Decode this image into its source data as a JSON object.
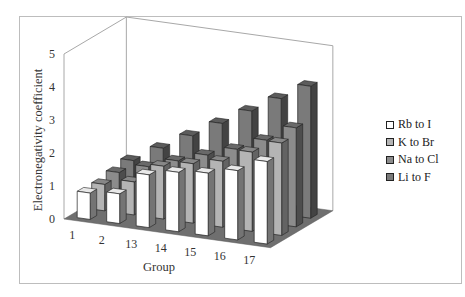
{
  "chart_data": {
    "type": "bar",
    "subtype": "3d-clustered-column",
    "title": "",
    "xlabel": "Group",
    "ylabel": "Electronegativity coefficient",
    "ylim": [
      0,
      5
    ],
    "yticks": [
      "0",
      "1",
      "2",
      "3",
      "4",
      "5"
    ],
    "categories": [
      "1",
      "2",
      "13",
      "14",
      "15",
      "16",
      "17"
    ],
    "series": [
      {
        "name": "Rb to I",
        "color": "#ffffff",
        "values": [
          0.8,
          0.9,
          1.6,
          1.8,
          1.9,
          2.1,
          2.5
        ]
      },
      {
        "name": "K to Br",
        "color": "#b4b4b4",
        "values": [
          0.8,
          1.0,
          1.6,
          1.8,
          2.0,
          2.4,
          2.8
        ]
      },
      {
        "name": "Na to Cl",
        "color": "#8c8c8c",
        "values": [
          0.9,
          1.2,
          1.5,
          1.8,
          2.1,
          2.5,
          3.0
        ]
      },
      {
        "name": "Li to F",
        "color": "#7a7a7a",
        "values": [
          1.0,
          1.5,
          2.0,
          2.5,
          3.0,
          3.5,
          4.0
        ]
      }
    ],
    "grid": false,
    "legend_position": "right",
    "floor_color": "#6f6f6f"
  },
  "legend": {
    "items": [
      {
        "label": "Rb to I",
        "color": "#ffffff"
      },
      {
        "label": "K to Br",
        "color": "#b4b4b4"
      },
      {
        "label": "Na to Cl",
        "color": "#8c8c8c"
      },
      {
        "label": "Li to F",
        "color": "#7a7a7a"
      }
    ]
  },
  "axes": {
    "y_title": "Electronegativity coefficient",
    "x_title": "Group"
  }
}
